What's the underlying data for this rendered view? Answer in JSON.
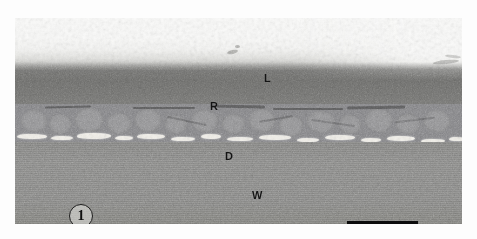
{
  "figure": {
    "number": "1",
    "type": "transmission-electron-micrograph"
  },
  "labels": {
    "lumen": "L",
    "rod_layer": "R",
    "dark_band": "D",
    "wall": "W"
  },
  "scale_bar": {
    "present": true,
    "caption": ""
  },
  "regions": [
    {
      "key": "L",
      "name": "lumen",
      "tone": "#fafaf9"
    },
    {
      "key": "R",
      "name": "rod-layer",
      "tone": "#6f6f6d"
    },
    {
      "key": "D",
      "name": "dark-band",
      "tone": "#f2f0ea"
    },
    {
      "key": "W",
      "name": "wall",
      "tone": "#8a8a88"
    }
  ],
  "colors": {
    "plate_background": "#8a8a8a",
    "page_background": "#ffffff",
    "annotation": "#141414",
    "scale_bar": "#0c0c0c"
  }
}
